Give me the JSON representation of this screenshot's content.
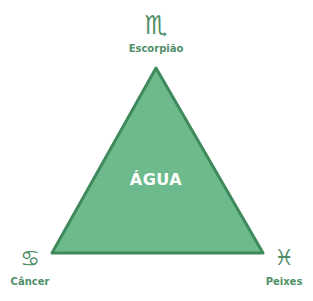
{
  "diagram": {
    "element": "ÁGUA",
    "colors": {
      "triangle_fill": "#6dbb8d",
      "triangle_stroke": "#3f8a5c",
      "text": "#4f8f68",
      "center_text": "#ffffff"
    },
    "signs": [
      {
        "name": "Escorpião",
        "symbol": "♏",
        "position": "top"
      },
      {
        "name": "Câncer",
        "symbol": "♋",
        "position": "bottom-left"
      },
      {
        "name": "Peixes",
        "symbol": "♓",
        "position": "bottom-right"
      }
    ]
  }
}
